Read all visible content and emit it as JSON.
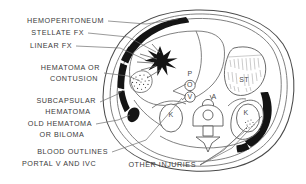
{
  "figure": {
    "type": "medical-line-diagram",
    "background_color": "#ffffff",
    "ink_color": "#4a4a4a",
    "blood_color": "#141414"
  },
  "callouts": [
    {
      "id": "hemoperitoneum",
      "lines": [
        "HEMOPERITONEUM"
      ],
      "align": "right"
    },
    {
      "id": "stellate-fx",
      "lines": [
        "STELLATE FX"
      ],
      "align": "right"
    },
    {
      "id": "linear-fx",
      "lines": [
        "LINEAR FX"
      ],
      "align": "right"
    },
    {
      "id": "hematoma-contusion",
      "lines": [
        "HEMATOMA OR",
        "CONTUSION"
      ],
      "align": "right"
    },
    {
      "id": "subcapsular-hematoma",
      "lines": [
        "SUBCAPSULAR",
        "HEMATOMA"
      ],
      "align": "right"
    },
    {
      "id": "old-hematoma-biloma",
      "lines": [
        "OLD HEMATOMA",
        "OR BILOMA"
      ],
      "align": "right"
    },
    {
      "id": "blood-outlines",
      "lines": [
        "BLOOD OUTLINES",
        "PORTAL V AND IVC"
      ],
      "align": "right"
    },
    {
      "id": "other-injuries",
      "lines": [
        "OTHER INJURIES"
      ],
      "align": "right"
    }
  ],
  "callout_text": {
    "hemoperitoneum": "HEMOPERITONEUM",
    "stellate_fx": "STELLATE FX",
    "linear_fx": "LINEAR FX",
    "hematoma_or": "HEMATOMA OR",
    "contusion": "CONTUSION",
    "subcapsular": "SUBCAPSULAR",
    "hematoma": "HEMATOMA",
    "old_hematoma": "OLD HEMATOMA",
    "or_biloma": "OR BILOMA",
    "blood_outlines": "BLOOD OUTLINES",
    "portal_v_and_ivc": "PORTAL V AND IVC",
    "other_injuries": "OTHER INJURIES"
  },
  "anatomy_labels": {
    "stomach": "ST",
    "portal_vein": "P",
    "ivc": "O",
    "vena_cava": "V",
    "aorta": "A",
    "kidney_left": "K",
    "kidney_right": "K"
  }
}
